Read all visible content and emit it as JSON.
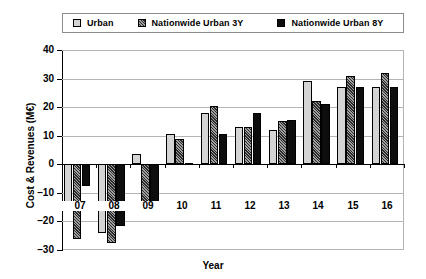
{
  "chart_data": {
    "type": "bar",
    "title": "",
    "xlabel": "Year",
    "ylabel": "Cost & Revenues (M€)",
    "categories": [
      "07",
      "08",
      "09",
      "10",
      "11",
      "12",
      "13",
      "14",
      "15",
      "16"
    ],
    "series": [
      {
        "name": "Urban",
        "values": [
          -16.0,
          -24.0,
          3.5,
          10.7,
          18.0,
          13.0,
          12.0,
          29.0,
          27.0,
          27.0
        ]
      },
      {
        "name": "Nationwide Urban 3Y",
        "values": [
          -26.0,
          -27.5,
          -16.0,
          9.0,
          20.5,
          13.0,
          15.3,
          22.0,
          31.0,
          32.0
        ]
      },
      {
        "name": "Nationwide Urban 8Y",
        "values": [
          -7.5,
          -21.5,
          -16.5,
          0.3,
          10.5,
          18.0,
          15.5,
          21.0,
          27.0,
          27.0
        ]
      }
    ],
    "ylim": [
      -30,
      40
    ],
    "yticks": [
      40,
      30,
      20,
      10,
      0,
      -10,
      -20,
      -30
    ],
    "ytick_labels": [
      "40",
      "30",
      "20",
      "10",
      "0",
      "–10",
      "–20",
      "–30"
    ],
    "grid": "horizontal",
    "legend_position": "top",
    "colors": {
      "urban": "#d4d4d4",
      "nationwide_3y": "#2b2b2b",
      "nationwide_8y": "#0d0d0d",
      "gridline": "#b4b4b4",
      "axis": "#000000",
      "background": "#ffffff"
    }
  },
  "legend": {
    "entries": [
      {
        "label": "Urban",
        "swatch": "urban-swatch-icon"
      },
      {
        "label": "Nationwide Urban 3Y",
        "swatch": "nationwide-3y-swatch-icon"
      },
      {
        "label": "Nationwide Urban 8Y",
        "swatch": "nationwide-8y-swatch-icon"
      }
    ]
  }
}
